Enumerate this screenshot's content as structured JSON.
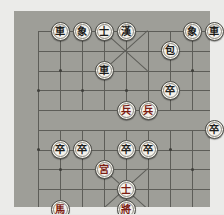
{
  "app": {
    "title": "Xiangqi Board",
    "board_color": "#9e9e98",
    "page_background": "#ebebe9",
    "line_color": "#5d5d58",
    "piece_face_color": "#f4f2ec",
    "red_piece_color": "#7c1c12",
    "black_piece_color": "#1c1c1a"
  },
  "board": {
    "files": 9,
    "ranks": 10,
    "river_label_left": "",
    "river_label_right": "",
    "pieces": [
      {
        "id": "p1",
        "glyph": "車",
        "name": "black-chariot",
        "side": "black",
        "file": 1,
        "rank": 0
      },
      {
        "id": "p2",
        "glyph": "象",
        "name": "black-elephant",
        "side": "black",
        "file": 2,
        "rank": 0
      },
      {
        "id": "p3",
        "glyph": "士",
        "name": "black-advisor",
        "side": "black",
        "file": 3,
        "rank": 0
      },
      {
        "id": "p4",
        "glyph": "漢",
        "name": "black-general",
        "side": "black",
        "file": 4,
        "rank": 0
      },
      {
        "id": "p5",
        "glyph": "象",
        "name": "black-elephant",
        "side": "black",
        "file": 7,
        "rank": 0
      },
      {
        "id": "p6",
        "glyph": "車",
        "name": "black-chariot",
        "side": "black",
        "file": 8,
        "rank": 0
      },
      {
        "id": "p7",
        "glyph": "包",
        "name": "black-cannon",
        "side": "black",
        "file": 6,
        "rank": 1
      },
      {
        "id": "p8",
        "glyph": "車",
        "name": "black-chariot",
        "side": "black",
        "file": 3,
        "rank": 2
      },
      {
        "id": "p9",
        "glyph": "卒",
        "name": "black-soldier",
        "side": "black",
        "file": 6,
        "rank": 3
      },
      {
        "id": "p10",
        "glyph": "兵",
        "name": "red-soldier",
        "side": "red",
        "file": 4,
        "rank": 4
      },
      {
        "id": "p11",
        "glyph": "兵",
        "name": "red-soldier",
        "side": "red",
        "file": 5,
        "rank": 4
      },
      {
        "id": "p12",
        "glyph": "卒",
        "name": "black-soldier",
        "side": "black",
        "file": 8,
        "rank": 5
      },
      {
        "id": "p13",
        "glyph": "卒",
        "name": "black-soldier",
        "side": "black",
        "file": 1,
        "rank": 6
      },
      {
        "id": "p14",
        "glyph": "卒",
        "name": "black-soldier",
        "side": "black",
        "file": 2,
        "rank": 6
      },
      {
        "id": "p15",
        "glyph": "卒",
        "name": "black-soldier",
        "side": "black",
        "file": 4,
        "rank": 6
      },
      {
        "id": "p16",
        "glyph": "卒",
        "name": "black-soldier",
        "side": "black",
        "file": 5,
        "rank": 6
      },
      {
        "id": "p17",
        "glyph": "宮",
        "name": "red-palace-piece",
        "side": "red",
        "file": 3,
        "rank": 7
      },
      {
        "id": "p18",
        "glyph": "士",
        "name": "red-advisor",
        "side": "red",
        "file": 4,
        "rank": 8
      },
      {
        "id": "p19",
        "glyph": "馬",
        "name": "red-horse",
        "side": "red",
        "file": 1,
        "rank": 9
      },
      {
        "id": "p20",
        "glyph": "將",
        "name": "red-general",
        "side": "red",
        "file": 4,
        "rank": 9
      }
    ]
  }
}
